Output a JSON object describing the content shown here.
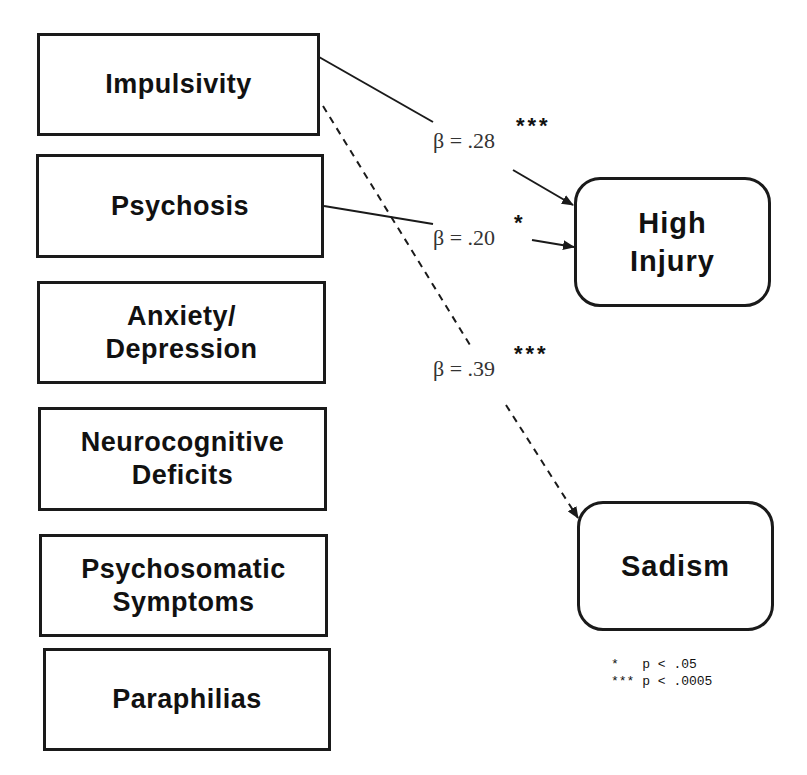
{
  "predictors": [
    {
      "id": "impulsivity",
      "label": "Impulsivity"
    },
    {
      "id": "psychosis",
      "label": "Psychosis"
    },
    {
      "id": "anxiety-depression",
      "label": "Anxiety/\nDepression"
    },
    {
      "id": "neurocognitive-deficits",
      "label": "Neurocognitive\nDeficits"
    },
    {
      "id": "psychosomatic-symptoms",
      "label": "Psychosomatic\nSymptoms"
    },
    {
      "id": "paraphilias",
      "label": "Paraphilias"
    }
  ],
  "outcomes": [
    {
      "id": "high-injury",
      "label": "High\nInjury"
    },
    {
      "id": "sadism",
      "label": "Sadism"
    }
  ],
  "paths": [
    {
      "from": "impulsivity",
      "to": "high-injury",
      "beta_label": "β = .28",
      "significance": "***",
      "style": "solid"
    },
    {
      "from": "psychosis",
      "to": "high-injury",
      "beta_label": "β = .20",
      "significance": "*",
      "style": "solid"
    },
    {
      "from": "impulsivity",
      "to": "sadism",
      "beta_label": "β = .39",
      "significance": "***",
      "style": "dashed"
    }
  ],
  "legend": {
    "line1": "*   p < .05",
    "line2": "*** p < .0005"
  },
  "colors": {
    "stroke": "#1a1a1a",
    "background": "#ffffff"
  }
}
